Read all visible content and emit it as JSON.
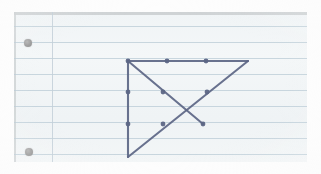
{
  "scan": {
    "title": "Hand-drawn geometric figure on ruled notebook paper",
    "background_color": "#fdfdfd",
    "paper_color": "#f2f5f6",
    "rule_color": "#b9cbd6",
    "margin_rule_color": "#c3cfd8",
    "punch_hole_color": "#9a9a9a",
    "ink_color": "#5c6585",
    "caption": ""
  },
  "paper": {
    "x": 14,
    "y": 12,
    "width": 293,
    "height": 150,
    "rule_spacing": 16,
    "rule_y_positions": [
      14,
      30,
      46,
      62,
      78,
      94,
      110,
      126,
      142
    ],
    "margin_rule_x": 52,
    "punch_holes": [
      {
        "cx": 28,
        "cy": 43,
        "r": 4
      },
      {
        "cx": 29,
        "cy": 152,
        "r": 4
      }
    ]
  },
  "chart_data": {
    "type": "diagram",
    "title": "Right triangle with crossing diagonals",
    "ink_color": "#5c6585",
    "stroke_width": 2.1,
    "vertices": {
      "A": {
        "label": "top-left",
        "x": 128,
        "y": 61
      },
      "B": {
        "label": "top-right",
        "x": 248,
        "y": 61
      },
      "C": {
        "label": "bottom-left",
        "x": 128,
        "y": 157
      },
      "D": {
        "label": "diagonal-endpoint",
        "x": 203,
        "y": 124
      }
    },
    "segments": [
      {
        "name": "top-edge",
        "from": [
          128,
          61
        ],
        "to": [
          248,
          61
        ]
      },
      {
        "name": "left-edge",
        "from": [
          128,
          61
        ],
        "to": [
          128,
          157
        ]
      },
      {
        "name": "hypotenuse-descending",
        "from": [
          128,
          61
        ],
        "to": [
          203,
          124
        ]
      },
      {
        "name": "hypotenuse-ascending",
        "from": [
          128,
          157
        ],
        "to": [
          248,
          61
        ]
      }
    ],
    "marked_points": [
      {
        "name": "vertex-top-left",
        "x": 128,
        "y": 61
      },
      {
        "name": "top-edge-point-1",
        "x": 167,
        "y": 61
      },
      {
        "name": "top-edge-point-2",
        "x": 206,
        "y": 61
      },
      {
        "name": "left-edge-point-1",
        "x": 128,
        "y": 92
      },
      {
        "name": "left-edge-point-2",
        "x": 128,
        "y": 124
      },
      {
        "name": "descending-point-1",
        "x": 163,
        "y": 92
      },
      {
        "name": "descending-endpoint",
        "x": 203,
        "y": 124
      },
      {
        "name": "ascending-point-1",
        "x": 163,
        "y": 124
      },
      {
        "name": "ascending-point-2",
        "x": 207,
        "y": 92
      }
    ],
    "dot_radius": 2.4,
    "xlabel": "",
    "ylabel": ""
  }
}
